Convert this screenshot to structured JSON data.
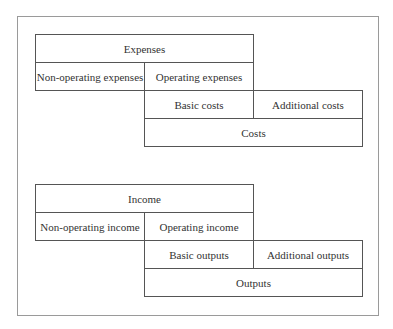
{
  "diagram": {
    "expenses_block": {
      "top": "Expenses",
      "non_operating": "Non-operating expenses",
      "operating": "Operating expenses",
      "basic": "Basic costs",
      "additional": "Additional costs",
      "bottom": "Costs"
    },
    "income_block": {
      "top": "Income",
      "non_operating": "Non-operating income",
      "operating": "Operating income",
      "basic": "Basic outputs",
      "additional": "Additional outputs",
      "bottom": "Outputs"
    }
  }
}
